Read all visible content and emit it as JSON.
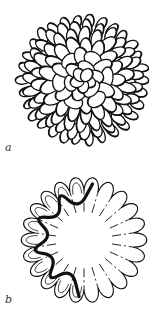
{
  "figure": {
    "panels": [
      {
        "id": "a",
        "label": "a",
        "description": "Surface drawing of a spherical virus capsid composed of many oval capsomers",
        "center": [
          83,
          80
        ],
        "radius": 63
      },
      {
        "id": "b",
        "label": "b",
        "description": "Cross-section of the capsid showing radial petal-like subunits; a thick dark line traces the folded outline on the left side",
        "center": [
          84,
          79
        ],
        "outer_radius": 63,
        "inner_radius": 27,
        "petal_count": 22
      }
    ],
    "colors": {
      "ink": "#111111",
      "paper": "#ffffff",
      "label": "#333333"
    }
  }
}
